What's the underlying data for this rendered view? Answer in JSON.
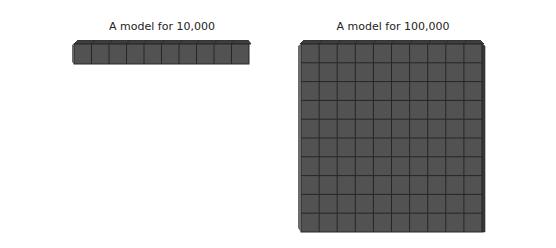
{
  "diagram": {
    "left_model": {
      "caption": "A model for 10,000",
      "shape": "rod",
      "cubes": 10,
      "columns": 10,
      "rows": 1
    },
    "right_model": {
      "caption": "A model for 100,000",
      "shape": "flat",
      "cubes": 100,
      "columns": 10,
      "rows": 10
    },
    "colors": {
      "face": "#525252",
      "top_face": "#3e3e3e",
      "side_face": "#3a3a3a",
      "grid_line": "#262626",
      "background": "#ffffff"
    }
  }
}
